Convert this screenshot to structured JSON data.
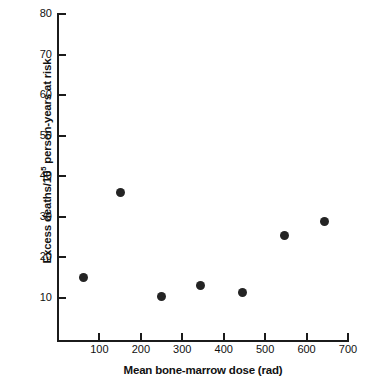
{
  "chart_data": {
    "type": "scatter",
    "title": "",
    "xlabel": "Mean bone-marrow dose (rad)",
    "ylabel_parts": {
      "before": "Excess deaths/10",
      "exponent": "5",
      "after": " person-years at risk"
    },
    "ylabel": "Excess deaths/10^5 person-years at risk",
    "xlim": [
      0,
      700
    ],
    "ylim": [
      0,
      80
    ],
    "xticks": [
      100,
      200,
      300,
      400,
      500,
      600,
      700
    ],
    "xtick_labels": [
      "100",
      "200",
      "300",
      "400",
      "500",
      "600",
      "700"
    ],
    "yticks": [
      10,
      20,
      30,
      40,
      50,
      60,
      70,
      80
    ],
    "ytick_labels": [
      "10",
      "20",
      "30",
      "40",
      "50",
      "60",
      "70",
      "80"
    ],
    "grid": false,
    "legend": null,
    "marker": "filled-circle",
    "marker_color": "#242424",
    "axis_color": "#1b1b1b",
    "background": "#ffffff",
    "points": [
      {
        "x": 62,
        "y": 15.0
      },
      {
        "x": 151,
        "y": 36.1
      },
      {
        "x": 250,
        "y": 10.3
      },
      {
        "x": 343,
        "y": 13.2
      },
      {
        "x": 446,
        "y": 11.4
      },
      {
        "x": 547,
        "y": 25.4
      },
      {
        "x": 643,
        "y": 28.8
      }
    ]
  }
}
